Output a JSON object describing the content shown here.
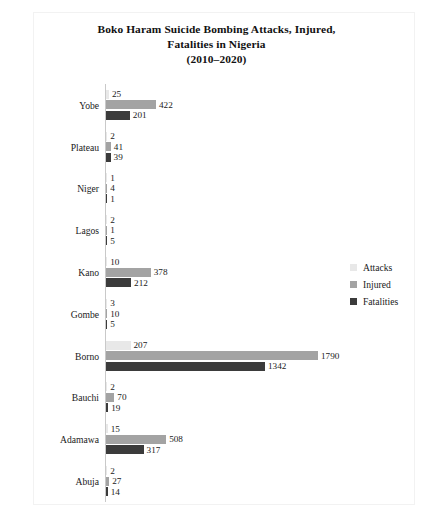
{
  "chart_data": {
    "type": "bar",
    "orientation": "horizontal",
    "title": "Boko Haram Suicide Bombing Attacks, Injured, Fatalities in Nigeria (2010–2020)",
    "title_lines": [
      "Boko Haram Suicide Bombing Attacks, Injured,",
      "Fatalities in Nigeria",
      "(2010–2020)"
    ],
    "xlabel": "",
    "ylabel": "",
    "grid": false,
    "legend_position": "right",
    "xlim": [
      0,
      1790
    ],
    "categories": [
      "Yobe",
      "Plateau",
      "Niger",
      "Lagos",
      "Kano",
      "Gombe",
      "Borno",
      "Bauchi",
      "Adamawa",
      "Abuja"
    ],
    "series": [
      {
        "name": "Attacks",
        "color": "#e8e8e8",
        "values": [
          25,
          2,
          1,
          2,
          10,
          3,
          207,
          2,
          15,
          2
        ]
      },
      {
        "name": "Injured",
        "color": "#a3a3a3",
        "values": [
          422,
          41,
          4,
          1,
          378,
          10,
          1790,
          70,
          508,
          27
        ]
      },
      {
        "name": "Fatalities",
        "color": "#3b3b3b",
        "values": [
          201,
          39,
          1,
          5,
          212,
          5,
          1342,
          19,
          317,
          14
        ]
      }
    ]
  },
  "legend": {
    "items": [
      {
        "label": "Attacks",
        "color": "#e8e8e8"
      },
      {
        "label": "Injured",
        "color": "#a3a3a3"
      },
      {
        "label": "Fatalities",
        "color": "#3b3b3b"
      }
    ]
  }
}
